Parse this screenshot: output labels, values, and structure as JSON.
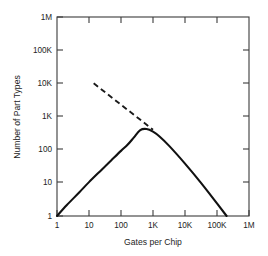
{
  "chart_data": {
    "type": "line",
    "title": "",
    "xlabel": "Gates per Chip",
    "ylabel": "Number of Part Types",
    "xscale": "log",
    "yscale": "log",
    "xlim": [
      1,
      1000000
    ],
    "ylim": [
      1,
      1000000
    ],
    "grid": false,
    "legend": "none",
    "xticklabels": [
      "1",
      "10",
      "100",
      "1K",
      "10K",
      "100K",
      "1M"
    ],
    "xtickvalues": [
      1,
      10,
      100,
      1000,
      10000,
      100000,
      1000000
    ],
    "yticklabels": [
      "1",
      "10",
      "100",
      "1K",
      "10K",
      "100K",
      "1M"
    ],
    "ytickvalues": [
      1,
      10,
      100,
      1000,
      10000,
      100000,
      1000000
    ],
    "series": [
      {
        "name": "part-types-curve",
        "style": "solid",
        "color": "#111111",
        "x": [
          1,
          2,
          5,
          10,
          25,
          50,
          100,
          160,
          250,
          400,
          630,
          1000,
          1600,
          3200,
          10000,
          31600,
          100000,
          200000
        ],
        "y": [
          1,
          2.1,
          5.2,
          10.5,
          25,
          48,
          92,
          140,
          230,
          390,
          420,
          350,
          250,
          130,
          38,
          10,
          2.4,
          1
        ]
      },
      {
        "name": "extrapolation-dashed-line",
        "style": "dashed",
        "color": "#1a1a1a",
        "x": [
          14,
          1000
        ],
        "y": [
          10000,
          400
        ]
      }
    ],
    "annotations": []
  },
  "axes": {
    "x_title": "Gates per Chip",
    "y_title": "Number of Part Types"
  }
}
